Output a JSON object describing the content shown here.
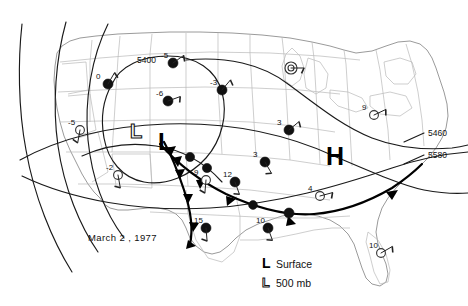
{
  "figure": {
    "type": "weather-map",
    "title_text": "March 2, 1977",
    "region": "Contiguous United States",
    "background_color": "#ffffff",
    "line_color": "#111111",
    "state_border_color": "#b9b9b9"
  },
  "date_label": "March 2 , 1977",
  "pressure_centers": [
    {
      "symbol": "L",
      "kind": "500mb-low",
      "style": "outline",
      "x": 137,
      "y": 131
    },
    {
      "symbol": "L",
      "kind": "surface-low",
      "style": "bold",
      "x": 166,
      "y": 140
    },
    {
      "symbol": "H",
      "kind": "surface-high",
      "style": "bold",
      "x": 336,
      "y": 155
    }
  ],
  "contour_labels": [
    {
      "value": "5400",
      "x": 150,
      "y": 60
    },
    {
      "value": "5460",
      "x": 432,
      "y": 135
    },
    {
      "value": "5580",
      "x": 432,
      "y": 155
    }
  ],
  "legend": {
    "surface": {
      "symbol": "L",
      "label": "Surface"
    },
    "upper": {
      "symbol": "L",
      "label": "500 mb"
    }
  },
  "stations": [
    {
      "value": "0",
      "x": 108,
      "y": 84,
      "marker": "filled"
    },
    {
      "value": "-5",
      "x": 173,
      "y": 63,
      "marker": "filled"
    },
    {
      "value": "-6",
      "x": 168,
      "y": 101,
      "marker": "filled"
    },
    {
      "value": "-3",
      "x": 222,
      "y": 90,
      "marker": "filled"
    },
    {
      "value": "-5",
      "x": 80,
      "y": 130,
      "marker": "open"
    },
    {
      "value": "-2",
      "x": 118,
      "y": 175,
      "marker": "open"
    },
    {
      "value": "9",
      "x": 206,
      "y": 180,
      "marker": "open"
    },
    {
      "value": "12",
      "x": 235,
      "y": 182,
      "marker": "filled"
    },
    {
      "value": "15",
      "x": 206,
      "y": 228,
      "marker": "filled"
    },
    {
      "value": "3",
      "x": 289,
      "y": 130,
      "marker": "filled"
    },
    {
      "value": "3",
      "x": 265,
      "y": 162,
      "marker": "filled"
    },
    {
      "value": "4",
      "x": 320,
      "y": 196,
      "marker": "open"
    },
    {
      "value": "10",
      "x": 268,
      "y": 228,
      "marker": "filled"
    },
    {
      "value": "10",
      "x": 381,
      "y": 253,
      "marker": "open"
    },
    {
      "value": "9",
      "x": 374,
      "y": 115,
      "marker": "open"
    },
    {
      "value": "",
      "x": 291,
      "y": 68,
      "marker": "ring"
    }
  ],
  "chart_data": {
    "type": "map",
    "title": "March 2 , 1977",
    "map_kind": "synoptic-weather-chart",
    "height_contours_dam": [
      "5400",
      "5460",
      "5580"
    ],
    "station_temperatures_c": [
      0,
      -5,
      -6,
      -3,
      -5,
      -2,
      9,
      12,
      15,
      3,
      3,
      4,
      10,
      10,
      9
    ],
    "pressure_center_symbols": [
      "L",
      "L",
      "H"
    ],
    "front_types": [
      "cold",
      "cold"
    ],
    "legend_entries": [
      "L Surface",
      "L 500 mb"
    ]
  }
}
